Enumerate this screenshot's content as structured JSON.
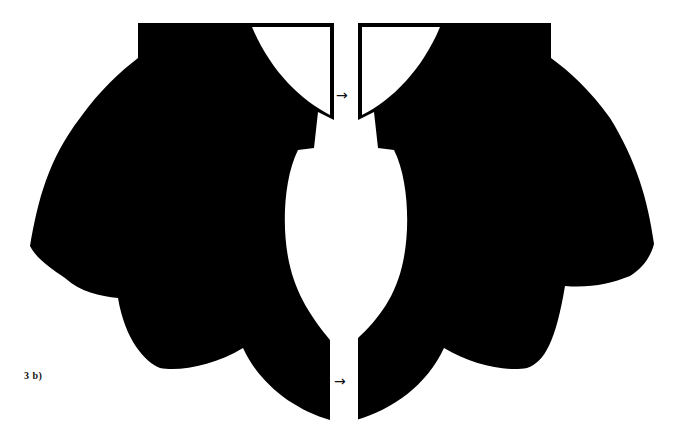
{
  "figure": {
    "label": "3 b)"
  },
  "markers": {
    "grain_arrow_top": "→",
    "grain_arrow_bottom": "→"
  },
  "colors": {
    "piece_fill": "#000000",
    "background": "#ffffff"
  },
  "pieces": [
    {
      "name": "left-collar-piece",
      "side": "left"
    },
    {
      "name": "right-collar-piece",
      "side": "right"
    }
  ]
}
